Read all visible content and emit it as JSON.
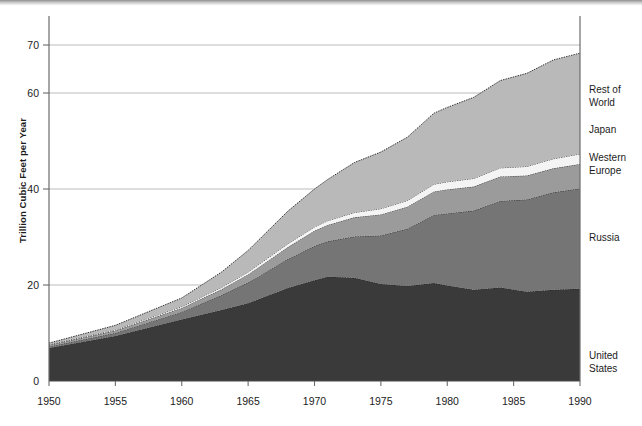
{
  "axes": {
    "ylabel": "Trillion Cubic Feet per Year",
    "yticks": [
      0,
      20,
      40,
      60,
      70
    ],
    "xticks": [
      1950,
      1955,
      1960,
      1965,
      1970,
      1975,
      1980,
      1985,
      1990
    ]
  },
  "legend": [
    {
      "key": "rest_of_world",
      "label": "Rest of\nWorld",
      "color": "#b9b9b9"
    },
    {
      "key": "japan",
      "label": "Japan",
      "color": "#f4f4f4"
    },
    {
      "key": "western_europe",
      "label": "Western\nEurope",
      "color": "#9b9b9b"
    },
    {
      "key": "russia",
      "label": "Russia",
      "color": "#757575"
    },
    {
      "key": "united_states",
      "label": "United\nStates",
      "color": "#3a3a3a"
    }
  ],
  "chart_data": {
    "type": "area",
    "stacked": true,
    "title": "",
    "xlabel": "",
    "ylabel": "Trillion Cubic Feet per Year",
    "xlim": [
      1950,
      1990
    ],
    "ylim": [
      0,
      74
    ],
    "grid": "horizontal",
    "legend_position": "right",
    "x": [
      1950,
      1955,
      1960,
      1963,
      1965,
      1968,
      1970,
      1971,
      1973,
      1975,
      1977,
      1979,
      1980,
      1982,
      1984,
      1986,
      1988,
      1990
    ],
    "series": [
      {
        "name": "United States",
        "color": "#3a3a3a",
        "values": [
          6.9,
          9.4,
          12.8,
          14.8,
          16.2,
          19.4,
          21.0,
          21.7,
          21.5,
          20.2,
          19.8,
          20.4,
          19.9,
          19.0,
          19.5,
          18.6,
          19.0,
          19.2
        ]
      },
      {
        "name": "Russia",
        "color": "#757575",
        "values": [
          0.3,
          0.6,
          1.6,
          3.1,
          4.3,
          6.0,
          7.1,
          7.4,
          8.6,
          10.1,
          11.9,
          14.2,
          15.0,
          16.5,
          18.0,
          19.2,
          20.3,
          20.9
        ]
      },
      {
        "name": "Western Europe",
        "color": "#9b9b9b",
        "values": [
          0.3,
          0.5,
          0.8,
          1.2,
          1.7,
          2.5,
          3.2,
          3.4,
          4.0,
          4.4,
          4.6,
          4.9,
          5.0,
          5.0,
          5.1,
          5.0,
          5.0,
          5.1
        ]
      },
      {
        "name": "Japan",
        "color": "#f4f4f4",
        "values": [
          0.1,
          0.2,
          0.3,
          0.4,
          0.5,
          0.7,
          0.8,
          0.9,
          1.0,
          1.2,
          1.3,
          1.5,
          1.6,
          1.7,
          1.8,
          1.9,
          2.0,
          2.1
        ]
      },
      {
        "name": "Rest of World",
        "color": "#b9b9b9",
        "values": [
          0.3,
          0.9,
          1.8,
          3.2,
          4.5,
          6.8,
          7.9,
          8.6,
          10.4,
          11.8,
          13.2,
          14.8,
          15.5,
          16.9,
          18.2,
          19.4,
          20.6,
          21.0
        ]
      }
    ],
    "totals_1990": {
      "united_states": 19.2,
      "through_russia": 40.1,
      "through_western_europe": 45.2,
      "through_japan": 47.3,
      "through_rest_of_world": 68.3
    }
  }
}
